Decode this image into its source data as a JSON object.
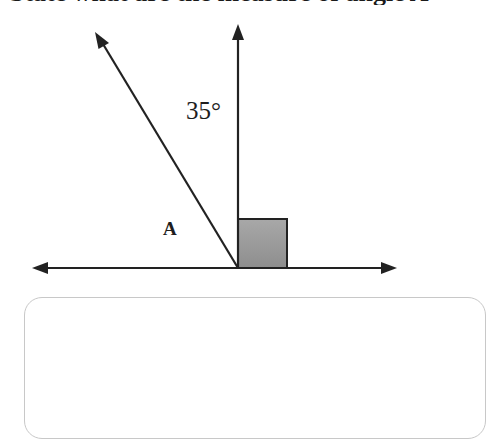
{
  "question": {
    "text_clipped": "State what are the measure of angle A"
  },
  "diagram": {
    "angle_label": "35°",
    "point_label": "A",
    "right_angle_marker_color": "#9a9a9a",
    "line_color": "#222222"
  },
  "answer_box": {
    "placeholder": ""
  }
}
